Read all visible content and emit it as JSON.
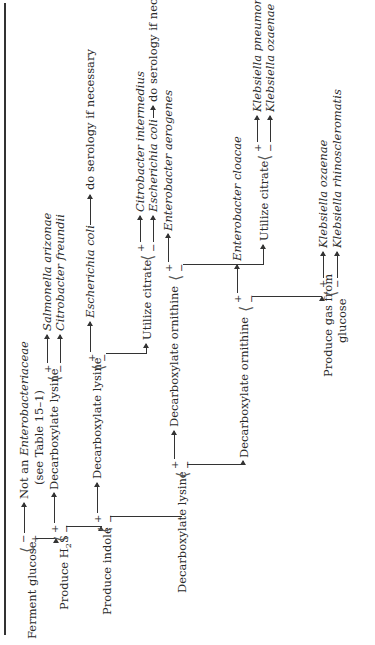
{
  "flowchart": {
    "root": {
      "label": "Ferment glucose",
      "minus": {
        "sign": "−",
        "result_line1": "Not an ",
        "result_italic": "Enterobacteriaceae",
        "result_line2": "(see Table 15–1)"
      },
      "plus": {
        "sign": "+"
      }
    },
    "h2s": {
      "label_prefix": "Produce H",
      "label_sub": "2",
      "label_suffix": "S",
      "plus": {
        "sign": "+",
        "next": "Decarboxylate lysine"
      },
      "minus": {
        "sign": "−"
      }
    },
    "h2s_lysine": {
      "plus": {
        "sign": "+",
        "result": "Salmonella arizonae"
      },
      "minus": {
        "sign": "−",
        "result": "Citrobacter freundii"
      }
    },
    "indole": {
      "label": "Produce indole",
      "plus": {
        "sign": "+",
        "next": "Decarboxylate lysine"
      },
      "minus": {
        "sign": "−"
      }
    },
    "indole_lysine": {
      "plus": {
        "sign": "+",
        "result": "Escherichia coli",
        "note": "do serology if necessary"
      },
      "minus": {
        "sign": "−",
        "next": "Utilize citrate"
      }
    },
    "citrate1": {
      "label": "Utilize citrate",
      "plus": {
        "sign": "+",
        "result": "Citrobacter intermedius"
      },
      "minus": {
        "sign": "−",
        "result": "Escherichia coli",
        "note": "do serology if necessary"
      }
    },
    "lysine2": {
      "label": "Decarboxylate lysine",
      "plus": {
        "sign": "+",
        "next": "Decarboxylate ornithine"
      },
      "minus": {
        "sign": "−"
      }
    },
    "ornithine1": {
      "label": "Decarboxylate ornithine",
      "plus": {
        "sign": "+",
        "result": "Enterobacter aerogenes"
      },
      "minus": {
        "sign": "−",
        "next": "Utilize citrate"
      }
    },
    "citrate2": {
      "label": "Utilize citrate",
      "plus": {
        "sign": "+",
        "result": "Klebsiella pneumoniae"
      },
      "minus": {
        "sign": "−",
        "result": "Klebsiella ozaenae"
      }
    },
    "ornithine2": {
      "label": "Decarboxylate ornithine",
      "plus": {
        "sign": "+",
        "result": "Enterobacter cloacae"
      },
      "minus": {
        "sign": "−"
      }
    },
    "gas": {
      "label_line1": "Produce gas from",
      "label_line2": "glucose",
      "plus": {
        "sign": "+",
        "result": "Klebsiella ozaenae"
      },
      "minus": {
        "sign": "−",
        "result": "Klebsiella rhinoscleromatis"
      }
    }
  }
}
